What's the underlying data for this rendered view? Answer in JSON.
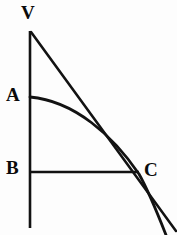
{
  "figure": {
    "width": 177,
    "height": 235,
    "background_color": "#fdfdfd",
    "ink_color": "#121212",
    "labels": [
      {
        "id": "V",
        "text": "V",
        "role": "apex-vertex",
        "x": 21,
        "y": 3
      },
      {
        "id": "A",
        "text": "A",
        "role": "curve-start-point",
        "x": 6,
        "y": 85
      },
      {
        "id": "B",
        "text": "B",
        "role": "base-point",
        "x": 6,
        "y": 158
      },
      {
        "id": "C",
        "text": "C",
        "role": "intersection-point",
        "x": 144,
        "y": 160
      }
    ],
    "strokes": {
      "vertical_axis": {
        "name": "vertical-axis-line",
        "description": "Vertical line through V, A and B extending below B",
        "x": 30,
        "y_top": 31,
        "y_bottom": 228,
        "width": 2.6
      },
      "horizontal_base": {
        "name": "horizontal-base-line",
        "description": "Horizontal line from B to C",
        "y": 172,
        "x_left": 30,
        "x_right": 139,
        "width": 2.4
      },
      "straight_line_VC": {
        "name": "straight-line-v-to-c",
        "description": "Straight line from apex V through C continuing to lower right",
        "x1": 31,
        "y1": 32,
        "x2": 176,
        "y2": 231,
        "width": 2.6
      },
      "curve_AC": {
        "name": "curve-a-to-c",
        "description": "Concave downward curve from A through C continuing to lower right",
        "start": {
          "x": 30,
          "y": 97
        },
        "control1": {
          "x": 75,
          "y": 101
        },
        "control2": {
          "x": 113,
          "y": 136
        },
        "end": {
          "x": 139,
          "y": 174
        },
        "tail_control": {
          "x": 152,
          "y": 198
        },
        "tail_end": {
          "x": 166,
          "y": 235
        },
        "width": 2.8
      }
    }
  }
}
